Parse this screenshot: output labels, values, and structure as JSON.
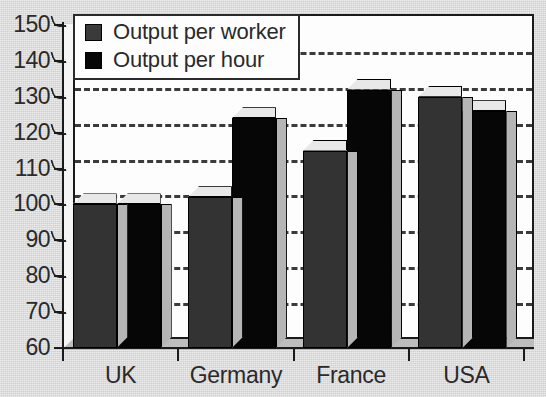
{
  "chart_data": {
    "type": "bar",
    "title": "",
    "subtitle": "",
    "xlabel": "",
    "ylabel": "",
    "categories": [
      "UK",
      "Germany",
      "France",
      "USA"
    ],
    "series": [
      {
        "name": "Output per worker",
        "values": [
          100,
          102,
          115,
          130
        ],
        "color": "#333333"
      },
      {
        "name": "Output per hour",
        "values": [
          100,
          124,
          132,
          126
        ],
        "color": "#060606"
      }
    ],
    "ylim": [
      60,
      150
    ],
    "ytick_values": [
      150,
      140,
      130,
      120,
      110,
      100,
      90,
      80,
      70,
      60
    ],
    "ytick_labels": [
      "150",
      "140",
      "130",
      "120",
      "110",
      "100",
      "90",
      "80",
      "70",
      "60"
    ],
    "grid": true,
    "grid_axis": "y",
    "legend_position": "top-left",
    "style": "3d-bar",
    "background_color": "#d9d9d9",
    "plot_background_color": "#fdfdfd",
    "axis_color": "#1a1a1a",
    "gridline_color": "#2b2b2b",
    "bar_side_color": "#b5b5b5",
    "bar_top_color": "#e8e8e8"
  },
  "legend": {
    "items": [
      {
        "label": "Output per worker",
        "swatch": "dark-gray-swatch"
      },
      {
        "label": "Output per hour",
        "swatch": "black-swatch"
      }
    ]
  }
}
